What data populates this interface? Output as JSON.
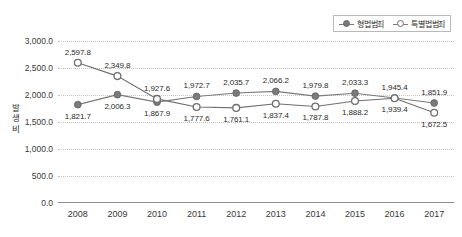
{
  "legend": {
    "position": "top-right",
    "entries": [
      {
        "label": "형법범죄",
        "marker": "filled-circle",
        "color": "#7a7a7a"
      },
      {
        "label": "특별법범죄",
        "marker": "open-circle",
        "color": "#6f6f6f"
      }
    ]
  },
  "axis": {
    "y_title_chars": [
      "발",
      "생",
      "비"
    ],
    "y_ticks": [
      "0.0",
      "500.0",
      "1,000.0",
      "1,500.0",
      "2,000.0",
      "2,500.0",
      "3,000.0"
    ],
    "x_ticks": [
      "2008",
      "2009",
      "2010",
      "2011",
      "2012",
      "2013",
      "2014",
      "2015",
      "2016",
      "2017"
    ]
  },
  "chart_data": {
    "type": "line",
    "title": "",
    "xlabel": "",
    "ylabel": "발생비",
    "categories": [
      "2008",
      "2009",
      "2010",
      "2011",
      "2012",
      "2013",
      "2014",
      "2015",
      "2016",
      "2017"
    ],
    "ylim": [
      0,
      3000
    ],
    "ytick_step": 500,
    "grid": true,
    "legend_position": "top-right",
    "series": [
      {
        "name": "형법범죄",
        "marker": "filled-circle",
        "color": "#7a7a7a",
        "values": [
          1821.7,
          2006.3,
          1867.9,
          1972.7,
          2035.7,
          2066.2,
          1979.8,
          2033.3,
          1945.4,
          1851.9
        ],
        "labels": [
          "1,821.7",
          "2,006.3",
          "1,867.9",
          "1,972.7",
          "2,035.7",
          "2,066.2",
          "1,979.8",
          "2,033.3",
          "1,945.4",
          "1,851.9"
        ],
        "label_pos": [
          "below",
          "below",
          "below",
          "above",
          "above",
          "above",
          "above",
          "above",
          "above",
          "above"
        ]
      },
      {
        "name": "특별법범죄",
        "marker": "open-circle",
        "color": "#6f6f6f",
        "values": [
          2597.8,
          2349.8,
          1927.6,
          1777.6,
          1761.1,
          1837.4,
          1787.8,
          1888.2,
          1939.4,
          1672.5
        ],
        "labels": [
          "2,597.8",
          "2,349.8",
          "1,927.6",
          "1,777.6",
          "1,761.1",
          "1,837.4",
          "1,787.8",
          "1,888.2",
          "1,939.4",
          "1,672.5"
        ],
        "label_pos": [
          "above",
          "above",
          "above",
          "below",
          "below",
          "below",
          "below",
          "below",
          "below",
          "below"
        ]
      }
    ]
  }
}
